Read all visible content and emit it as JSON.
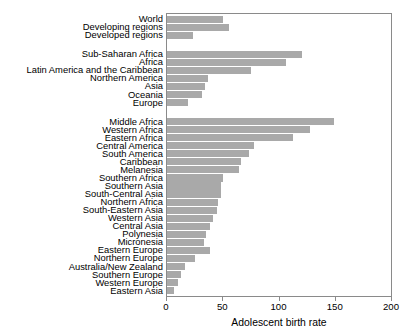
{
  "chart_data": {
    "type": "bar",
    "orientation": "horizontal",
    "title": "",
    "xlabel": "Adolescent birth rate",
    "ylabel": "",
    "xlim": [
      0,
      200
    ],
    "xticks": [
      0,
      50,
      100,
      150,
      200
    ],
    "grid": false,
    "legend": null,
    "bar_color": "#a9a9a9",
    "categories": [
      "World",
      "Developing regions",
      "Developed regions",
      "Sub-Saharan Africa",
      "Africa",
      "Latin America and the Caribbean",
      "Northern America",
      "Asia",
      "Oceania",
      "Europe",
      "Middle Africa",
      "Western Africa",
      "Eastern Africa",
      "Central America",
      "South America",
      "Caribbean",
      "Melanesia",
      "Southern Africa",
      "Southern Asia",
      "South-Central Asia",
      "Northern Africa",
      "South-Eastern Asia",
      "Western Asia",
      "Central Asia",
      "Polynesia",
      "Micronesia",
      "Eastern Europe",
      "Northern Europe",
      "Australia/New Zealand",
      "Southern Europe",
      "Western Europe",
      "Eastern Asia"
    ],
    "values": [
      50,
      55,
      23,
      120,
      106,
      75,
      36,
      34,
      31,
      19,
      148,
      127,
      112,
      77,
      73,
      66,
      64,
      50,
      48,
      48,
      45,
      44,
      41,
      38,
      35,
      33,
      38,
      25,
      16,
      12,
      10,
      6
    ],
    "group_breaks_after": [
      2,
      9
    ],
    "groups": [
      {
        "name": "global",
        "categories": [
          "World",
          "Developing regions",
          "Developed regions"
        ],
        "values": [
          50,
          55,
          23
        ]
      },
      {
        "name": "major-regions",
        "categories": [
          "Sub-Saharan Africa",
          "Africa",
          "Latin America and the Caribbean",
          "Northern America",
          "Asia",
          "Oceania",
          "Europe"
        ],
        "values": [
          120,
          106,
          75,
          36,
          34,
          31,
          19
        ]
      },
      {
        "name": "sub-regions",
        "categories": [
          "Middle Africa",
          "Western Africa",
          "Eastern Africa",
          "Central America",
          "South America",
          "Caribbean",
          "Melanesia",
          "Southern Africa",
          "Southern Asia",
          "South-Central Asia",
          "Northern Africa",
          "South-Eastern Asia",
          "Western Asia",
          "Central Asia",
          "Polynesia",
          "Micronesia",
          "Eastern Europe",
          "Northern Europe",
          "Australia/New Zealand",
          "Southern Europe",
          "Western Europe",
          "Eastern Asia"
        ],
        "values": [
          148,
          127,
          112,
          77,
          73,
          66,
          64,
          50,
          48,
          48,
          45,
          44,
          41,
          38,
          35,
          33,
          38,
          25,
          16,
          12,
          10,
          6
        ]
      }
    ]
  }
}
